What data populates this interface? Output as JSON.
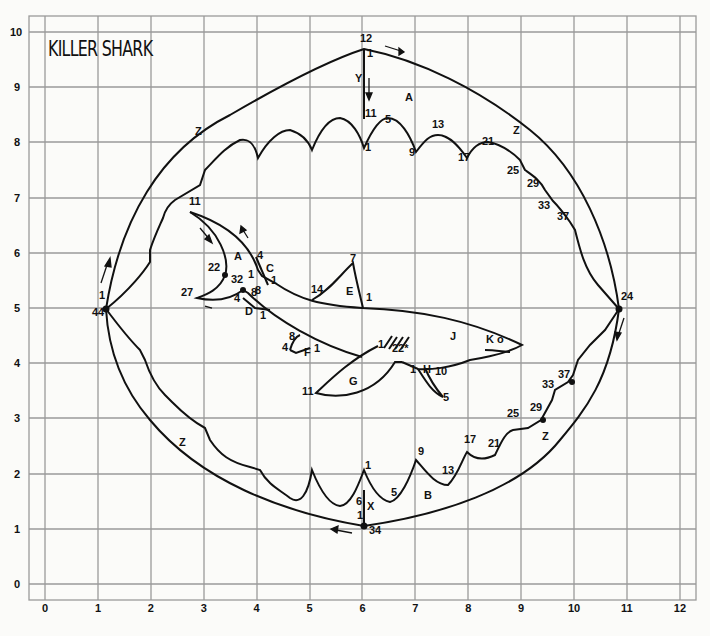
{
  "title": "KILLER SHARK",
  "axes": {
    "x_ticks": [
      "0",
      "1",
      "2",
      "3",
      "4",
      "5",
      "6",
      "7",
      "8",
      "9",
      "10",
      "11",
      "12"
    ],
    "y_ticks": [
      "0",
      "1",
      "2",
      "3",
      "4",
      "5",
      "6",
      "7",
      "8",
      "9",
      "10"
    ]
  },
  "labels": [
    {
      "t": "12",
      "x": 360,
      "y": 39
    },
    {
      "t": "1",
      "x": 367,
      "y": 54
    },
    {
      "t": "Y",
      "x": 355,
      "y": 79
    },
    {
      "t": "A",
      "x": 405,
      "y": 98
    },
    {
      "t": "11",
      "x": 365,
      "y": 114
    },
    {
      "t": "5",
      "x": 385,
      "y": 120
    },
    {
      "t": "13",
      "x": 432,
      "y": 125
    },
    {
      "t": "Z",
      "x": 195,
      "y": 132
    },
    {
      "t": "1",
      "x": 365,
      "y": 148
    },
    {
      "t": "9",
      "x": 409,
      "y": 153
    },
    {
      "t": "17",
      "x": 458,
      "y": 158
    },
    {
      "t": "21",
      "x": 482,
      "y": 142
    },
    {
      "t": "Z",
      "x": 513,
      "y": 131
    },
    {
      "t": "25",
      "x": 507,
      "y": 171
    },
    {
      "t": "29",
      "x": 527,
      "y": 184
    },
    {
      "t": "33",
      "x": 538,
      "y": 206
    },
    {
      "t": "37",
      "x": 557,
      "y": 217
    },
    {
      "t": "11",
      "x": 189,
      "y": 202
    },
    {
      "t": "A",
      "x": 234,
      "y": 257
    },
    {
      "t": "22",
      "x": 208,
      "y": 268
    },
    {
      "t": "4",
      "x": 257,
      "y": 256
    },
    {
      "t": "C",
      "x": 266,
      "y": 269
    },
    {
      "t": "1",
      "x": 248,
      "y": 275
    },
    {
      "t": "1",
      "x": 271,
      "y": 281
    },
    {
      "t": "32",
      "x": 231,
      "y": 280
    },
    {
      "t": "8",
      "x": 255,
      "y": 291
    },
    {
      "t": "8",
      "x": 251,
      "y": 293
    },
    {
      "t": "27",
      "x": 181,
      "y": 293
    },
    {
      "t": "4",
      "x": 234,
      "y": 299
    },
    {
      "t": "D",
      "x": 245,
      "y": 312
    },
    {
      "t": "1",
      "x": 260,
      "y": 316
    },
    {
      "t": "7",
      "x": 350,
      "y": 259
    },
    {
      "t": "14",
      "x": 311,
      "y": 290
    },
    {
      "t": "E",
      "x": 346,
      "y": 292
    },
    {
      "t": "1",
      "x": 366,
      "y": 298
    },
    {
      "t": "1",
      "x": 99,
      "y": 296
    },
    {
      "t": "44",
      "x": 92,
      "y": 313
    },
    {
      "t": "24",
      "x": 621,
      "y": 297
    },
    {
      "t": "8",
      "x": 289,
      "y": 337
    },
    {
      "t": "4",
      "x": 282,
      "y": 348
    },
    {
      "t": "F",
      "x": 304,
      "y": 353
    },
    {
      "t": "1",
      "x": 314,
      "y": 349
    },
    {
      "t": "1",
      "x": 378,
      "y": 345
    },
    {
      "t": "22*",
      "x": 392,
      "y": 349
    },
    {
      "t": "J",
      "x": 450,
      "y": 337
    },
    {
      "t": "K o",
      "x": 486,
      "y": 340
    },
    {
      "t": "1",
      "x": 410,
      "y": 370
    },
    {
      "t": "H",
      "x": 423,
      "y": 370
    },
    {
      "t": "10",
      "x": 435,
      "y": 372
    },
    {
      "t": "5",
      "x": 443,
      "y": 398
    },
    {
      "t": "G",
      "x": 349,
      "y": 382
    },
    {
      "t": "11",
      "x": 302,
      "y": 392
    },
    {
      "t": "33",
      "x": 542,
      "y": 385
    },
    {
      "t": "37",
      "x": 558,
      "y": 375
    },
    {
      "t": "25",
      "x": 507,
      "y": 414
    },
    {
      "t": "29",
      "x": 530,
      "y": 408
    },
    {
      "t": "Z",
      "x": 542,
      "y": 437
    },
    {
      "t": "Z",
      "x": 179,
      "y": 443
    },
    {
      "t": "17",
      "x": 464,
      "y": 440
    },
    {
      "t": "21",
      "x": 488,
      "y": 444
    },
    {
      "t": "9",
      "x": 418,
      "y": 452
    },
    {
      "t": "13",
      "x": 442,
      "y": 471
    },
    {
      "t": "1",
      "x": 365,
      "y": 466
    },
    {
      "t": "5",
      "x": 391,
      "y": 493
    },
    {
      "t": "B",
      "x": 424,
      "y": 496
    },
    {
      "t": "6",
      "x": 356,
      "y": 502
    },
    {
      "t": "X",
      "x": 367,
      "y": 507
    },
    {
      "t": "1",
      "x": 357,
      "y": 516
    },
    {
      "t": "34",
      "x": 369,
      "y": 531
    }
  ]
}
